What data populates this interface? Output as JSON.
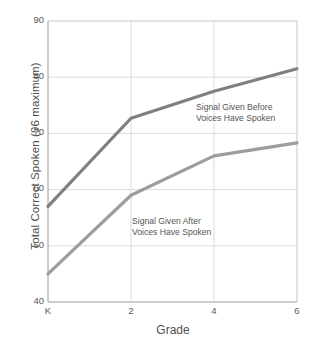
{
  "chart_data": {
    "type": "line",
    "title": "",
    "xlabel": "Grade",
    "ylabel": "Total Correct Spoken (96 maximum)",
    "categories": [
      "K",
      "2",
      "4",
      "6"
    ],
    "x": [
      0,
      2,
      4,
      6
    ],
    "xlim": [
      0,
      6
    ],
    "ylim": [
      40,
      90
    ],
    "yticks": [
      "40",
      "50",
      "60",
      "70",
      "80",
      "90"
    ],
    "ytick_values": [
      40,
      50,
      60,
      70,
      80,
      90
    ],
    "xticks": [
      "K",
      "2",
      "4",
      "6"
    ],
    "grid": "both",
    "legend": "inline-annotations",
    "series": [
      {
        "name": "Signal Given Before Voices Have Spoken",
        "label_line1": "Signal Given Before",
        "label_line2": "Voices Have Spoken",
        "color": "#808080",
        "values": [
          57,
          72.7,
          77.5,
          81.5
        ]
      },
      {
        "name": "Signal Given After Voices Have Spoken",
        "label_line1": "Signal Given After",
        "label_line2": "Voices Have Spoken",
        "color": "#9d9d9d",
        "values": [
          45,
          59,
          66,
          68.3
        ]
      }
    ],
    "annotations": [
      {
        "text": "Signal Given Before",
        "x": 196,
        "y": 106
      },
      {
        "text": "Voices Have Spoken",
        "x": 196,
        "y": 116
      },
      {
        "text": "Signal Given After",
        "x": 132,
        "y": 220
      },
      {
        "text": "Voices Have Spoken",
        "x": 132,
        "y": 230
      }
    ],
    "colors": {
      "axis": "#8a8a8a",
      "grid": "#d8d8d8",
      "text": "#4f4f4f",
      "background": "#ffffff"
    }
  }
}
